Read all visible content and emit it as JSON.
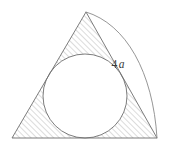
{
  "figure": {
    "background_color": "#ffffff",
    "stroke_color": "#6e6e6e",
    "hatch_color": "#9a9a9a",
    "label_color": "#3a3a3a",
    "canvas": {
      "width": 169,
      "height": 153
    }
  },
  "labels": {
    "side_measure": "4",
    "side_measure_symbol": "a",
    "side_measure_full": "4a"
  },
  "geometry": {
    "triangle": {
      "name": "outer-triangle",
      "apex": {
        "x": 86,
        "y": 12
      },
      "bottom_left": {
        "x": 12,
        "y": 138
      },
      "bottom_right": {
        "x": 157,
        "y": 138
      },
      "points": "86,12 12,138 157,138"
    },
    "circle": {
      "name": "inscribed-circle",
      "center": {
        "x": 85,
        "y": 96
      },
      "radius": 42
    },
    "arc": {
      "name": "side-measure-arc",
      "from": {
        "x": 86,
        "y": 12
      },
      "to": {
        "x": 157,
        "y": 138
      },
      "bulge": "outward-right",
      "path": "M 86 12 C 126 24, 153 72, 157 138"
    },
    "label_position": {
      "x": 118,
      "y": 68
    }
  },
  "hatching": {
    "angle_degrees": 45,
    "spacing_px": 4,
    "line_width_px": 0.7,
    "region": "triangle-minus-circle"
  }
}
